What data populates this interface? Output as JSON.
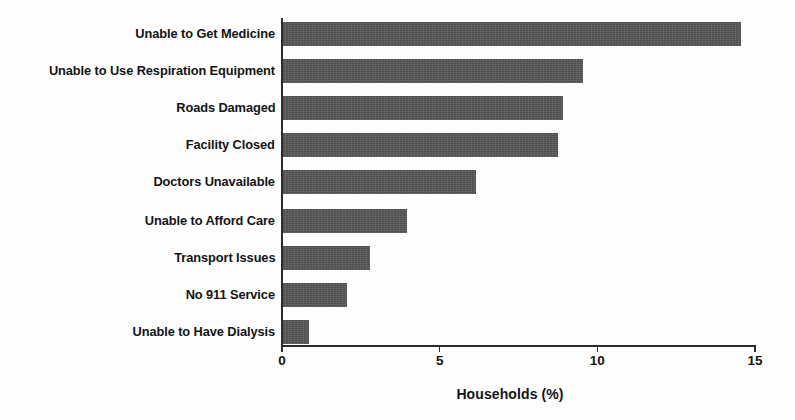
{
  "chart_data": {
    "type": "bar",
    "orientation": "horizontal",
    "title": "",
    "xlabel": "Households (%)",
    "ylabel": "",
    "xlim": [
      0,
      15
    ],
    "xticks": [
      "0",
      "5",
      "10",
      "15"
    ],
    "xtick_values": [
      0,
      5,
      10,
      15
    ],
    "grid": false,
    "legend": null,
    "bar_color": "#575757",
    "axis_color": "#2c2c2c",
    "categories": [
      "Unable to Get Medicine",
      "Unable to Use Respiration Equipment",
      "Roads Damaged",
      "Facility Closed",
      "Doctors Unavailable",
      "Unable to Afford Care",
      "Transport Issues",
      "No 911 Service",
      "Unable to Have Dialysis"
    ],
    "values": [
      14.55,
      9.55,
      8.9,
      8.75,
      6.15,
      3.95,
      2.8,
      2.05,
      0.85
    ]
  }
}
